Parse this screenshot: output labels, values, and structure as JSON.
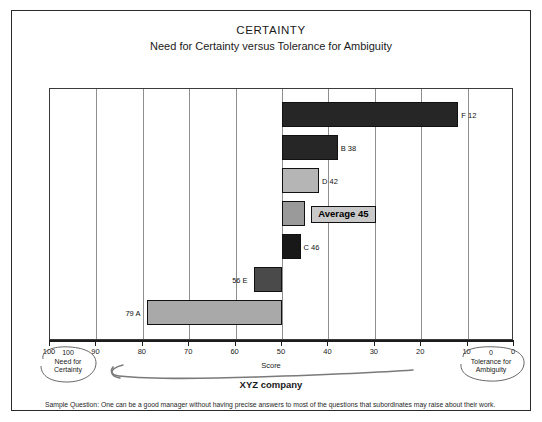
{
  "chart_data": {
    "type": "bar",
    "orientation": "horizontal",
    "title": "CERTAINTY",
    "subtitle": "Need for Certainty versus Tolerance for Ambiguity",
    "xlabel": "Score",
    "ylabel": "",
    "xlim": [
      100,
      0
    ],
    "x_axis_reversed": true,
    "grid": true,
    "baseline": 50,
    "xticks": [
      100,
      90,
      80,
      70,
      60,
      50,
      40,
      30,
      20,
      10,
      0
    ],
    "xtick_labels": [
      "100",
      "90",
      "80",
      "70",
      "60",
      "50",
      "40",
      "30",
      "20",
      "10",
      "0"
    ],
    "categories": [
      "F",
      "B",
      "D",
      "Average",
      "C",
      "E",
      "A"
    ],
    "values": [
      12,
      38,
      42,
      45,
      46,
      56,
      79
    ],
    "bars": [
      {
        "name": "F",
        "value": 12,
        "label": "F 12",
        "fill": "#262626",
        "label_side": "right"
      },
      {
        "name": "B",
        "value": 38,
        "label": "B 38",
        "fill": "#262626",
        "label_side": "right"
      },
      {
        "name": "D",
        "value": 42,
        "label": "D 42",
        "fill": "#b5b5b5",
        "label_side": "right"
      },
      {
        "name": "Average",
        "value": 45,
        "label": "Average 45",
        "fill": "#9a9a9a",
        "label_side": "right",
        "is_average": true
      },
      {
        "name": "C",
        "value": 46,
        "label": "C 46",
        "fill": "#181818",
        "label_side": "right"
      },
      {
        "name": "E",
        "value": 56,
        "label": "56 E",
        "fill": "#4a4a4a",
        "label_side": "left"
      },
      {
        "name": "A",
        "value": 79,
        "label": "79 A",
        "fill": "#a9a9a9",
        "label_side": "left"
      }
    ],
    "annotations": {
      "average_box": "Average 45",
      "left_pole": {
        "value": "100",
        "line1": "Need for",
        "line2": "Certainty"
      },
      "right_pole": {
        "value": "0",
        "line1": "Tolerance for",
        "line2": "Ambiguity"
      },
      "arrow_label": "XYZ company"
    },
    "footnote": "Sample Question: One can be a good manager without having precise answers to most of the questions that subordinates may raise about their work."
  },
  "colors": {
    "frame": "#2a2a2a",
    "grid": "#8e8e8e",
    "axis": "#1c1c1c",
    "average_fill": "#c9c9c9"
  }
}
